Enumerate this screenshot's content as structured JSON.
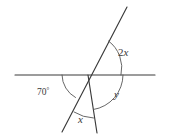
{
  "figure": {
    "type": "angle-diagram",
    "background_color": "#ffffff",
    "stroke_color": "#3a3a3a",
    "arc_color": "#565656",
    "width": 169,
    "height": 138
  },
  "vertex": {
    "x": 88,
    "y": 75,
    "name": "intersection-point"
  },
  "lines": [
    {
      "name": "horizontal-line",
      "x1": 15,
      "y1": 75,
      "x2": 155,
      "y2": 75
    },
    {
      "name": "slanted-transversal-line",
      "x1": 127,
      "y1": 7,
      "x2": 62,
      "y2": 132
    },
    {
      "name": "near-vertical-ray",
      "x1": 88,
      "y1": 75,
      "x2": 97,
      "y2": 133
    }
  ],
  "arcs": [
    {
      "name": "arc-70-degrees",
      "path": "M 62 75 A 26 26 0 0 0 75 97",
      "for_label": "70"
    },
    {
      "name": "arc-2x",
      "path": "M 109 40 A 32 32 0 0 1 120 75",
      "for_label": "2x"
    },
    {
      "name": "arc-y",
      "path": "M 123 75 A 35 35 0 0 1 94 110",
      "for_label": "y"
    },
    {
      "name": "arc-x",
      "path": "M 75 113 A 40 40 0 0 0 94 118",
      "for_label": "x"
    }
  ],
  "labels": [
    {
      "name": "label-70-degrees",
      "text": "70",
      "suffix": "°",
      "x": 38,
      "y": 95,
      "italic": false
    },
    {
      "name": "label-2x",
      "text": "2",
      "variable": "x",
      "x": 118,
      "y": 55,
      "italic": true
    },
    {
      "name": "label-y",
      "text": "",
      "variable": "y",
      "x": 114,
      "y": 97,
      "italic": true
    },
    {
      "name": "label-x",
      "text": "",
      "variable": "x",
      "x": 78,
      "y": 122,
      "italic": true
    }
  ]
}
